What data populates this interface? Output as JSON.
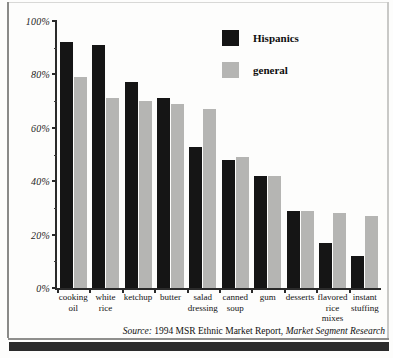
{
  "chart_data": {
    "type": "bar",
    "title": "",
    "xlabel": "",
    "ylabel": "",
    "ylim": [
      0,
      100
    ],
    "ytick_labels": [
      "100%",
      "80%",
      "60%",
      "40%",
      "20%",
      "0%"
    ],
    "ytick_values": [
      100,
      80,
      60,
      40,
      20,
      0
    ],
    "grid": false,
    "legend_position": "top-right",
    "categories": [
      "cooking oil",
      "white rice",
      "ketchup",
      "butter",
      "salad dressing",
      "canned soup",
      "gum",
      "desserts",
      "flavored rice mixes",
      "instant stuffing"
    ],
    "series": [
      {
        "name": "Hispanics",
        "color": "#151515",
        "values": [
          92,
          91,
          77,
          71,
          53,
          48,
          42,
          29,
          17,
          12
        ]
      },
      {
        "name": "general",
        "color": "#b5b5b3",
        "values": [
          79,
          71,
          70,
          69,
          67,
          49,
          42,
          29,
          28,
          27
        ]
      }
    ],
    "source_prefix": "Source:",
    "source_text": "1994 MSR Ethnic Market Report,",
    "source_publisher": "Market Segment Research"
  }
}
